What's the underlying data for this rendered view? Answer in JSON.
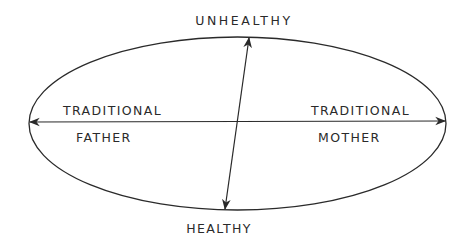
{
  "diagram": {
    "type": "axis-ellipse",
    "labels": {
      "top": "UNHEALTHY",
      "bottom": "HEALTHY",
      "left_upper": "TRADITIONAL",
      "left_lower": "FATHER",
      "right_upper": "TRADITIONAL",
      "right_lower": "MOTHER"
    },
    "axes": [
      {
        "name": "horizontal",
        "from": "TRADITIONAL FATHER",
        "to": "TRADITIONAL MOTHER",
        "arrows": "both"
      },
      {
        "name": "vertical",
        "from": "HEALTHY",
        "to": "UNHEALTHY",
        "arrows": "both"
      }
    ],
    "colors": {
      "stroke": "#2a2a2a",
      "background": "#ffffff"
    }
  }
}
